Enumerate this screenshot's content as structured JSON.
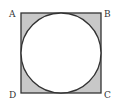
{
  "diagram": {
    "labels": {
      "A": "A",
      "B": "B",
      "C": "C",
      "D": "D"
    },
    "colors": {
      "shade": "#c8c8c8",
      "stroke": "#333333",
      "circle_fill": "#ffffff"
    }
  }
}
